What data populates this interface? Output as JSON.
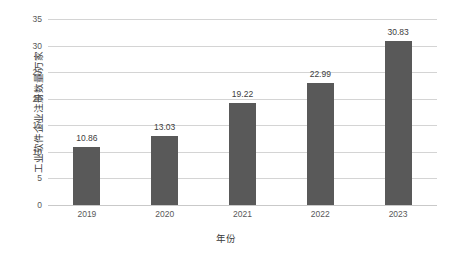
{
  "chart_data": {
    "type": "bar",
    "title": "",
    "subtitle": "",
    "xlabel": "年份",
    "ylabel": "工业软件企业注册数量/万家",
    "categories": [
      "2019",
      "2020",
      "2021",
      "2022",
      "2023"
    ],
    "values": [
      10.86,
      13.03,
      19.22,
      22.99,
      30.83
    ],
    "value_labels": [
      "10.86",
      "13.03",
      "19.22",
      "22.99",
      "30.83"
    ],
    "series": [
      {
        "name": "工业软件企业注册数量",
        "values": [
          10.86,
          13.03,
          19.22,
          22.99,
          30.83
        ]
      }
    ],
    "ylim": [
      0,
      35
    ],
    "ytick_values": [
      0,
      5,
      10,
      15,
      20,
      25,
      30,
      35
    ],
    "ytick_labels": [
      "0",
      "5",
      "10",
      "15",
      "20",
      "25",
      "30",
      "35"
    ],
    "grid": true,
    "grid_axis": "y",
    "legend": false,
    "legend_position": "none",
    "bar_color": "#595959",
    "grid_color": "#d4d4d4",
    "background_color": "#ffffff",
    "text_color": "#595959"
  }
}
